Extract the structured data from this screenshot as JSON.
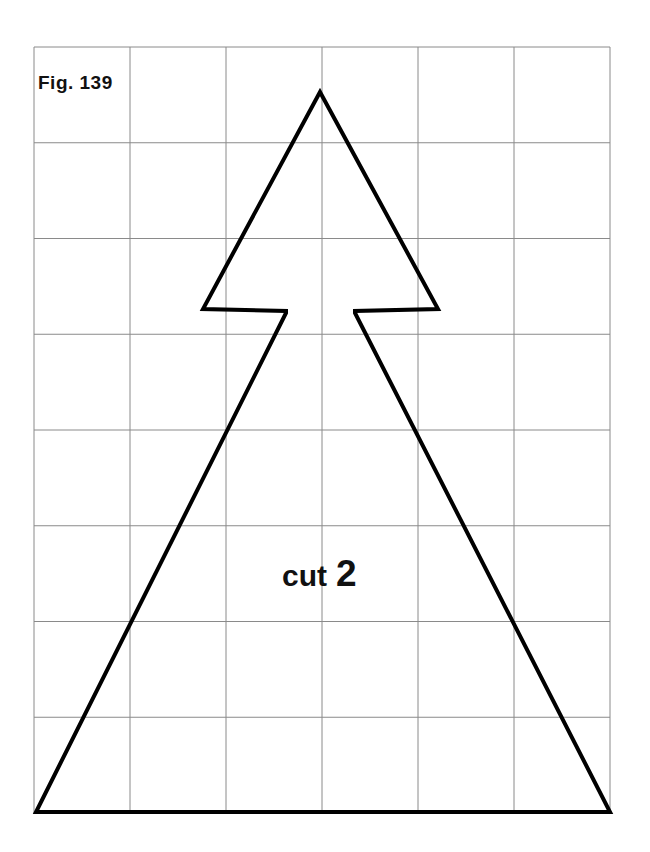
{
  "page": {
    "width": 650,
    "height": 852,
    "background_color": "#ffffff"
  },
  "figure": {
    "label": "Fig. 139",
    "cut_instruction_word": "cut",
    "cut_instruction_count": "2",
    "shape_name": "arrow-tree-pattern-piece",
    "outline_color": "#000000",
    "outline_width": 4,
    "grid": {
      "color": "#8a8a8a",
      "line_width": 1,
      "columns": 6,
      "rows": 8,
      "left": 34,
      "top": 47,
      "right": 610,
      "bottom": 813,
      "cell_width": 96,
      "cell_height": 95.75,
      "x_lines": [
        34,
        130,
        226,
        322,
        418,
        514,
        610
      ],
      "y_lines": [
        47,
        142.75,
        238.5,
        334.25,
        430,
        525.75,
        621.5,
        717.25,
        813
      ]
    },
    "outline_points": [
      [
        320,
        92
      ],
      [
        438,
        309
      ],
      [
        355,
        311
      ],
      [
        355,
        313
      ],
      [
        610,
        812
      ],
      [
        36,
        812
      ],
      [
        286,
        313
      ],
      [
        286,
        311
      ],
      [
        203,
        309
      ]
    ],
    "fig_label_position": {
      "x": 38,
      "y": 89
    },
    "cut_label_position": {
      "x": 282,
      "y": 586
    },
    "cut_count_position": {
      "x": 336,
      "y": 586
    }
  }
}
